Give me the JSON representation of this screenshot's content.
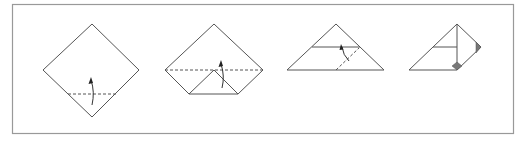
{
  "figure": {
    "steps": [
      {
        "index": 1,
        "shape": "square-diamond",
        "action": "valley-fold bottom corner up",
        "fold_line": "dashed",
        "arrow": "up"
      },
      {
        "index": 2,
        "shape": "diamond-with-folded-bottom",
        "action": "fold in half along horizontal diagonal",
        "fold_line": "dashed",
        "arrow": "up"
      },
      {
        "index": 3,
        "shape": "triangle",
        "action": "fold diagonal flap",
        "fold_line": "dashed",
        "arrow": "up"
      },
      {
        "index": 4,
        "shape": "folded-triangle",
        "action": "result",
        "markers": [
          "shaded-triangle",
          "shaded-diamond"
        ]
      }
    ],
    "colors": {
      "line": "#555555",
      "shade": "#777777",
      "frame": "#999999",
      "background": "#ffffff"
    }
  }
}
